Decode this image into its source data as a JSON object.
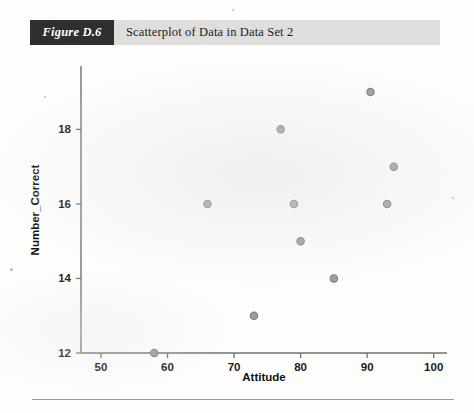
{
  "figure": {
    "tag": "Figure D.6",
    "caption": "Scatterplot of Data in Data Set 2"
  },
  "colors": {
    "band": "#dededd",
    "tag_background": "#2f2f2f",
    "tag_text": "#ffffff",
    "axis": "#6f6f6f",
    "point_fill": "#9b9b9b",
    "point_stroke": "#7a7a7a",
    "text": "#1a1a1a",
    "page": "#fdfdfc"
  },
  "chart_data": {
    "type": "scatter",
    "title": "Scatterplot of Data in Data Set 2",
    "xlabel": "Attitude",
    "ylabel": "Number_Correct",
    "xlim": [
      47,
      102
    ],
    "ylim": [
      12,
      19.7
    ],
    "xticks": [
      50,
      60,
      70,
      80,
      90,
      100
    ],
    "yticks": [
      12,
      14,
      16,
      18
    ],
    "xtick_labels": [
      "50",
      "60",
      "70",
      "80",
      "90",
      "100"
    ],
    "ytick_labels": [
      "12",
      "14",
      "16",
      "18"
    ],
    "grid": false,
    "legend": null,
    "series": [
      {
        "name": "Data Set 2",
        "points": [
          {
            "x": 58,
            "y": 12
          },
          {
            "x": 66,
            "y": 16
          },
          {
            "x": 73,
            "y": 13
          },
          {
            "x": 77,
            "y": 18
          },
          {
            "x": 79,
            "y": 16
          },
          {
            "x": 80,
            "y": 15
          },
          {
            "x": 85,
            "y": 14
          },
          {
            "x": 90.5,
            "y": 19
          },
          {
            "x": 93,
            "y": 16
          },
          {
            "x": 94,
            "y": 17
          }
        ]
      }
    ]
  }
}
